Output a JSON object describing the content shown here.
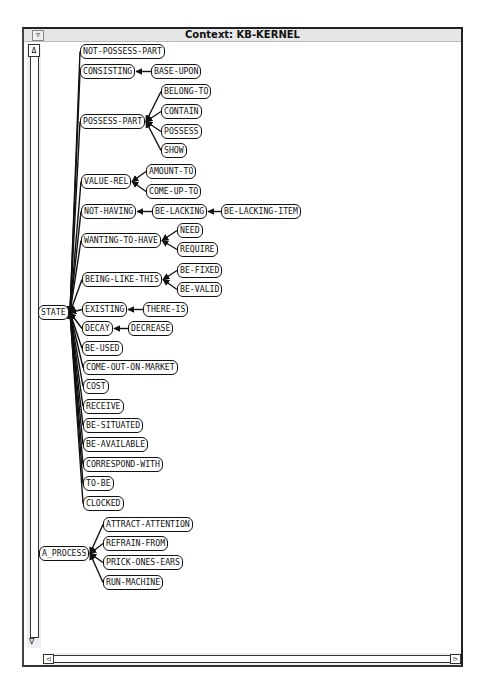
{
  "window": {
    "title": "Context: KB-KERNEL",
    "menu_icon": "▽",
    "scroll_up_icon": "Δ",
    "scroll_down_icon": "∇",
    "scroll_left_icon": "◁",
    "scroll_right_icon": "▷"
  },
  "graph": {
    "nodes": [
      {
        "id": "n0",
        "label": "NOT-POSSESS-PART",
        "x": 80,
        "y": 44
      },
      {
        "id": "n1",
        "label": "CONSISTING",
        "x": 80,
        "y": 64
      },
      {
        "id": "n2",
        "label": "BASE-UPON",
        "x": 151,
        "y": 64
      },
      {
        "id": "n3",
        "label": "BELONG-TO",
        "x": 161,
        "y": 84
      },
      {
        "id": "n4",
        "label": "CONTAIN",
        "x": 161,
        "y": 104
      },
      {
        "id": "n5",
        "label": "POSSESS-PART",
        "x": 80,
        "y": 114
      },
      {
        "id": "n6",
        "label": "POSSESS",
        "x": 161,
        "y": 124
      },
      {
        "id": "n7",
        "label": "SHOW",
        "x": 161,
        "y": 143
      },
      {
        "id": "n8",
        "label": "AMOUNT-TO",
        "x": 146,
        "y": 164
      },
      {
        "id": "n9",
        "label": "VALUE-REL",
        "x": 81,
        "y": 174
      },
      {
        "id": "n10",
        "label": "COME-UP-TO",
        "x": 146,
        "y": 184
      },
      {
        "id": "n11",
        "label": "NOT-HAVING",
        "x": 81,
        "y": 204
      },
      {
        "id": "n12",
        "label": "BE-LACKING",
        "x": 152,
        "y": 204
      },
      {
        "id": "n13",
        "label": "BE-LACKING-ITEM",
        "x": 221,
        "y": 204
      },
      {
        "id": "n14",
        "label": "NEED",
        "x": 177,
        "y": 223
      },
      {
        "id": "n15",
        "label": "WANTING-TO-HAVE",
        "x": 81,
        "y": 233
      },
      {
        "id": "n16",
        "label": "REQUIRE",
        "x": 177,
        "y": 242
      },
      {
        "id": "n17",
        "label": "BE-FIXED",
        "x": 177,
        "y": 263
      },
      {
        "id": "n18",
        "label": "BEING-LIKE-THIS",
        "x": 82,
        "y": 272
      },
      {
        "id": "n19",
        "label": "BE-VALID",
        "x": 177,
        "y": 282
      },
      {
        "id": "n20",
        "label": "STATE",
        "x": 38,
        "y": 305
      },
      {
        "id": "n21",
        "label": "EXISTING",
        "x": 82,
        "y": 302
      },
      {
        "id": "n22",
        "label": "THERE-IS",
        "x": 143,
        "y": 302
      },
      {
        "id": "n23",
        "label": "DECAY",
        "x": 82,
        "y": 321
      },
      {
        "id": "n24",
        "label": "DECREASE",
        "x": 128,
        "y": 321
      },
      {
        "id": "n25",
        "label": "BE-USED",
        "x": 82,
        "y": 341
      },
      {
        "id": "n26",
        "label": "COME-OUT-ON-MARKET",
        "x": 83,
        "y": 360
      },
      {
        "id": "n27",
        "label": "COST",
        "x": 83,
        "y": 379
      },
      {
        "id": "n28",
        "label": "RECEIVE",
        "x": 83,
        "y": 399
      },
      {
        "id": "n29",
        "label": "BE-SITUATED",
        "x": 83,
        "y": 418
      },
      {
        "id": "n30",
        "label": "BE-AVAILABLE",
        "x": 83,
        "y": 437
      },
      {
        "id": "n31",
        "label": "CORRESPOND-WITH",
        "x": 83,
        "y": 457
      },
      {
        "id": "n32",
        "label": "TO-BE",
        "x": 83,
        "y": 476
      },
      {
        "id": "n33",
        "label": "CLOCKED",
        "x": 83,
        "y": 496
      },
      {
        "id": "n34",
        "label": "ATTRACT-ATTENTION",
        "x": 103,
        "y": 517
      },
      {
        "id": "n35",
        "label": "REFRAIN-FROM",
        "x": 103,
        "y": 536
      },
      {
        "id": "n36",
        "label": "A_PROCESS",
        "x": 39,
        "y": 546
      },
      {
        "id": "n37",
        "label": "PRICK-ONES-EARS",
        "x": 103,
        "y": 555
      },
      {
        "id": "n38",
        "label": "RUN-MACHINE",
        "x": 103,
        "y": 575
      }
    ],
    "edges": [
      [
        "n0",
        "n20"
      ],
      [
        "n1",
        "n20"
      ],
      [
        "n5",
        "n20"
      ],
      [
        "n9",
        "n20"
      ],
      [
        "n11",
        "n20"
      ],
      [
        "n15",
        "n20"
      ],
      [
        "n18",
        "n20"
      ],
      [
        "n21",
        "n20"
      ],
      [
        "n23",
        "n20"
      ],
      [
        "n25",
        "n20"
      ],
      [
        "n26",
        "n20"
      ],
      [
        "n27",
        "n20"
      ],
      [
        "n28",
        "n20"
      ],
      [
        "n29",
        "n20"
      ],
      [
        "n30",
        "n20"
      ],
      [
        "n31",
        "n20"
      ],
      [
        "n32",
        "n20"
      ],
      [
        "n33",
        "n20"
      ],
      [
        "n2",
        "n1"
      ],
      [
        "n3",
        "n5"
      ],
      [
        "n4",
        "n5"
      ],
      [
        "n6",
        "n5"
      ],
      [
        "n7",
        "n5"
      ],
      [
        "n8",
        "n9"
      ],
      [
        "n10",
        "n9"
      ],
      [
        "n12",
        "n11"
      ],
      [
        "n13",
        "n12"
      ],
      [
        "n14",
        "n15"
      ],
      [
        "n16",
        "n15"
      ],
      [
        "n17",
        "n18"
      ],
      [
        "n19",
        "n18"
      ],
      [
        "n22",
        "n21"
      ],
      [
        "n24",
        "n23"
      ],
      [
        "n34",
        "n36"
      ],
      [
        "n35",
        "n36"
      ],
      [
        "n37",
        "n36"
      ],
      [
        "n38",
        "n36"
      ]
    ]
  }
}
